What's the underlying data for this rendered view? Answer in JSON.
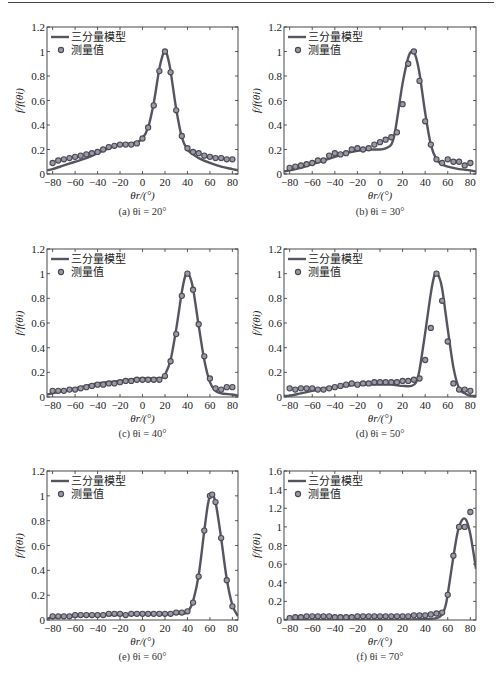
{
  "figure": {
    "legend": {
      "model_label": "三分量模型",
      "measured_label": "测量值"
    },
    "ylabel": "f/f(θi)",
    "xlabel": "θr/(°)",
    "colors": {
      "line": "#555560",
      "marker_edge": "#4a4a55",
      "marker_fill": "#9a9aa4",
      "axis": "#333333"
    }
  },
  "chart_data": [
    {
      "id": "a",
      "type": "line+scatter",
      "caption": "(a) θi = 20°",
      "incident_angle": 20,
      "xlim": [
        -85,
        85
      ],
      "ylim": [
        0,
        1.2
      ],
      "xticks": [
        -80,
        -60,
        -40,
        -20,
        0,
        20,
        40,
        60,
        80
      ],
      "yticks": [
        0,
        0.2,
        0.4,
        0.6,
        0.8,
        1,
        1.2
      ],
      "ytick_labels": [
        "0",
        "0.2",
        "0.4",
        "0.6",
        "0.8",
        "1",
        "1.2"
      ],
      "xlabel": "θr/(°)",
      "ylabel": "f/f(θi)",
      "series": [
        {
          "name": "三分量模型",
          "kind": "line",
          "x": [
            -85,
            -80,
            -70,
            -60,
            -50,
            -40,
            -30,
            -20,
            -10,
            -5,
            0,
            5,
            10,
            15,
            18,
            20,
            22,
            25,
            30,
            35,
            40,
            45,
            50,
            60,
            70,
            80,
            85
          ],
          "y": [
            0.03,
            0.04,
            0.07,
            0.1,
            0.13,
            0.17,
            0.21,
            0.24,
            0.25,
            0.26,
            0.29,
            0.38,
            0.58,
            0.86,
            0.97,
            1.0,
            0.97,
            0.84,
            0.53,
            0.3,
            0.2,
            0.16,
            0.13,
            0.09,
            0.06,
            0.04,
            0.03
          ]
        },
        {
          "name": "测量值",
          "kind": "scatter",
          "x": [
            -80,
            -75,
            -70,
            -65,
            -60,
            -55,
            -50,
            -45,
            -40,
            -35,
            -30,
            -25,
            -20,
            -15,
            -10,
            -5,
            0,
            5,
            10,
            15,
            20,
            25,
            30,
            35,
            40,
            45,
            50,
            55,
            60,
            65,
            70,
            75,
            80
          ],
          "y": [
            0.09,
            0.11,
            0.12,
            0.13,
            0.14,
            0.15,
            0.16,
            0.17,
            0.18,
            0.2,
            0.22,
            0.23,
            0.24,
            0.24,
            0.24,
            0.25,
            0.29,
            0.38,
            0.56,
            0.84,
            1.0,
            0.83,
            0.52,
            0.31,
            0.21,
            0.18,
            0.17,
            0.15,
            0.14,
            0.13,
            0.13,
            0.12,
            0.12
          ]
        }
      ]
    },
    {
      "id": "b",
      "type": "line+scatter",
      "caption": "(b) θi = 30°",
      "incident_angle": 30,
      "xlim": [
        -85,
        85
      ],
      "ylim": [
        0,
        1.2
      ],
      "xticks": [
        -80,
        -60,
        -40,
        -20,
        0,
        20,
        40,
        60,
        80
      ],
      "yticks": [
        0,
        0.2,
        0.4,
        0.6,
        0.8,
        1,
        1.2
      ],
      "ytick_labels": [
        "0",
        "0.2",
        "0.4",
        "0.6",
        "0.8",
        "1",
        "1.2"
      ],
      "xlabel": "θr/(°)",
      "ylabel": "f/f(θi)",
      "series": [
        {
          "name": "三分量模型",
          "kind": "line",
          "x": [
            -85,
            -80,
            -70,
            -60,
            -50,
            -40,
            -30,
            -20,
            -10,
            0,
            5,
            10,
            13,
            16,
            20,
            25,
            28,
            30,
            32,
            35,
            40,
            45,
            50,
            55,
            60,
            70,
            80,
            85
          ],
          "y": [
            0.02,
            0.03,
            0.05,
            0.08,
            0.11,
            0.14,
            0.17,
            0.19,
            0.2,
            0.2,
            0.21,
            0.24,
            0.33,
            0.5,
            0.74,
            0.95,
            1.0,
            0.99,
            0.95,
            0.82,
            0.5,
            0.24,
            0.12,
            0.08,
            0.06,
            0.04,
            0.03,
            0.02
          ]
        },
        {
          "name": "测量值",
          "kind": "scatter",
          "x": [
            -80,
            -75,
            -70,
            -65,
            -60,
            -55,
            -50,
            -45,
            -40,
            -35,
            -30,
            -25,
            -20,
            -15,
            -10,
            -5,
            0,
            5,
            10,
            15,
            20,
            25,
            30,
            35,
            40,
            45,
            50,
            55,
            60,
            65,
            70,
            75,
            80
          ],
          "y": [
            0.05,
            0.06,
            0.07,
            0.08,
            0.09,
            0.11,
            0.11,
            0.15,
            0.17,
            0.16,
            0.17,
            0.2,
            0.21,
            0.2,
            0.21,
            0.24,
            0.26,
            0.28,
            0.3,
            0.34,
            0.57,
            0.9,
            1.0,
            0.76,
            0.43,
            0.24,
            0.12,
            0.09,
            0.12,
            0.1,
            0.1,
            0.07,
            0.09
          ]
        }
      ]
    },
    {
      "id": "c",
      "type": "line+scatter",
      "caption": "(c) θi = 40°",
      "incident_angle": 40,
      "xlim": [
        -85,
        85
      ],
      "ylim": [
        0,
        1.2
      ],
      "xticks": [
        -80,
        -60,
        -40,
        -20,
        0,
        20,
        40,
        60,
        80
      ],
      "yticks": [
        0,
        0.2,
        0.4,
        0.6,
        0.8,
        1,
        1.2
      ],
      "ytick_labels": [
        "0",
        "0.2",
        "0.4",
        "0.6",
        "0.8",
        "1",
        "1.2"
      ],
      "xlabel": "θr/(°)",
      "ylabel": "f/f(θi)",
      "series": [
        {
          "name": "三分量模型",
          "kind": "line",
          "x": [
            -85,
            -80,
            -70,
            -60,
            -50,
            -40,
            -30,
            -20,
            -10,
            0,
            10,
            15,
            18,
            20,
            25,
            30,
            35,
            38,
            40,
            42,
            45,
            50,
            55,
            60,
            65,
            70,
            80,
            85
          ],
          "y": [
            0.02,
            0.03,
            0.05,
            0.07,
            0.09,
            0.11,
            0.12,
            0.13,
            0.14,
            0.15,
            0.15,
            0.15,
            0.16,
            0.18,
            0.3,
            0.55,
            0.85,
            0.98,
            1.0,
            0.98,
            0.88,
            0.58,
            0.3,
            0.12,
            0.05,
            0.03,
            0.02,
            0.01
          ]
        },
        {
          "name": "测量值",
          "kind": "scatter",
          "x": [
            -80,
            -75,
            -70,
            -65,
            -60,
            -55,
            -50,
            -45,
            -40,
            -35,
            -30,
            -25,
            -20,
            -15,
            -10,
            -5,
            0,
            5,
            10,
            15,
            20,
            25,
            30,
            35,
            40,
            45,
            50,
            55,
            60,
            65,
            70,
            75,
            80
          ],
          "y": [
            0.05,
            0.05,
            0.05,
            0.06,
            0.06,
            0.07,
            0.08,
            0.09,
            0.1,
            0.1,
            0.11,
            0.11,
            0.12,
            0.13,
            0.13,
            0.14,
            0.14,
            0.14,
            0.14,
            0.14,
            0.17,
            0.29,
            0.51,
            0.82,
            1.0,
            0.87,
            0.59,
            0.33,
            0.15,
            0.07,
            0.06,
            0.08,
            0.08
          ]
        }
      ]
    },
    {
      "id": "d",
      "type": "line+scatter",
      "caption": "(d) θi = 50°",
      "incident_angle": 50,
      "xlim": [
        -85,
        85
      ],
      "ylim": [
        0,
        1.2
      ],
      "xticks": [
        -80,
        -60,
        -40,
        -20,
        0,
        20,
        40,
        60,
        80
      ],
      "yticks": [
        0,
        0.2,
        0.4,
        0.6,
        0.8,
        1,
        1.2
      ],
      "ytick_labels": [
        "0",
        "0.2",
        "0.4",
        "0.6",
        "0.8",
        "1",
        "1.2"
      ],
      "xlabel": "θr/(°)",
      "ylabel": "f/f(θi)",
      "series": [
        {
          "name": "三分量模型",
          "kind": "line",
          "x": [
            -85,
            -80,
            -70,
            -60,
            -50,
            -40,
            -30,
            -20,
            -10,
            0,
            10,
            20,
            28,
            32,
            35,
            40,
            45,
            48,
            50,
            52,
            55,
            60,
            65,
            70,
            75,
            80,
            85
          ],
          "y": [
            0.01,
            0.01,
            0.03,
            0.05,
            0.07,
            0.08,
            0.09,
            0.1,
            0.1,
            0.1,
            0.1,
            0.09,
            0.09,
            0.12,
            0.22,
            0.52,
            0.84,
            0.98,
            1.0,
            0.98,
            0.88,
            0.55,
            0.24,
            0.07,
            0.03,
            0.01,
            0.01
          ]
        },
        {
          "name": "测量值",
          "kind": "scatter",
          "x": [
            -80,
            -75,
            -70,
            -65,
            -60,
            -55,
            -50,
            -45,
            -40,
            -35,
            -30,
            -25,
            -20,
            -15,
            -10,
            -5,
            0,
            5,
            10,
            15,
            20,
            25,
            30,
            35,
            40,
            45,
            50,
            55,
            60,
            65,
            70,
            75,
            80
          ],
          "y": [
            0.07,
            0.06,
            0.07,
            0.07,
            0.07,
            0.06,
            0.06,
            0.07,
            0.08,
            0.09,
            0.1,
            0.11,
            0.1,
            0.11,
            0.11,
            0.12,
            0.12,
            0.12,
            0.12,
            0.12,
            0.13,
            0.13,
            0.14,
            0.15,
            0.3,
            0.56,
            1.0,
            0.78,
            0.45,
            0.11,
            0.06,
            0.06,
            0.05
          ]
        }
      ]
    },
    {
      "id": "e",
      "type": "line+scatter",
      "caption": "(e) θi = 60°",
      "incident_angle": 60,
      "xlim": [
        -85,
        85
      ],
      "ylim": [
        0,
        1.2
      ],
      "xticks": [
        -80,
        -60,
        -40,
        -20,
        0,
        20,
        40,
        60,
        80
      ],
      "yticks": [
        0,
        0.2,
        0.4,
        0.6,
        0.8,
        1,
        1.2
      ],
      "ytick_labels": [
        "0",
        "0.2",
        "0.4",
        "0.6",
        "0.8",
        "1",
        "1.2"
      ],
      "xlabel": "θr/(°)",
      "ylabel": "f/f(θi)",
      "series": [
        {
          "name": "三分量模型",
          "kind": "line",
          "x": [
            -85,
            -80,
            -60,
            -40,
            -20,
            0,
            20,
            35,
            40,
            42,
            45,
            50,
            55,
            58,
            60,
            62,
            64,
            66,
            70,
            75,
            80,
            85
          ],
          "y": [
            0.01,
            0.02,
            0.03,
            0.04,
            0.04,
            0.05,
            0.05,
            0.05,
            0.06,
            0.09,
            0.15,
            0.36,
            0.72,
            0.92,
            1.0,
            1.02,
            0.98,
            0.9,
            0.66,
            0.33,
            0.12,
            0.03
          ]
        },
        {
          "name": "测量值",
          "kind": "scatter",
          "x": [
            -80,
            -75,
            -70,
            -65,
            -60,
            -55,
            -50,
            -45,
            -40,
            -35,
            -30,
            -25,
            -20,
            -15,
            -10,
            -5,
            0,
            5,
            10,
            15,
            20,
            25,
            30,
            35,
            40,
            45,
            50,
            55,
            60,
            62,
            65,
            70,
            75,
            80
          ],
          "y": [
            0.03,
            0.03,
            0.03,
            0.03,
            0.04,
            0.04,
            0.04,
            0.04,
            0.04,
            0.04,
            0.05,
            0.05,
            0.05,
            0.04,
            0.05,
            0.05,
            0.05,
            0.05,
            0.05,
            0.05,
            0.05,
            0.05,
            0.06,
            0.06,
            0.07,
            0.14,
            0.35,
            0.72,
            1.0,
            1.01,
            0.95,
            0.66,
            0.32,
            0.11
          ]
        }
      ]
    },
    {
      "id": "f",
      "type": "line+scatter",
      "caption": "(f) θi = 70°",
      "incident_angle": 70,
      "xlim": [
        -85,
        85
      ],
      "ylim": [
        0,
        1.6
      ],
      "xticks": [
        -80,
        -60,
        -40,
        -20,
        0,
        20,
        40,
        60,
        80
      ],
      "yticks": [
        0,
        0.2,
        0.4,
        0.6,
        0.8,
        1,
        1.2,
        1.4,
        1.6
      ],
      "ytick_labels": [
        "0",
        "0.2",
        "0.4",
        "0.6",
        "0.8",
        "1",
        "1.2",
        "1.4",
        "1.6"
      ],
      "xlabel": "θr/(°)",
      "ylabel": "f/f(θi)",
      "series": [
        {
          "name": "三分量模型",
          "kind": "line",
          "x": [
            -85,
            -80,
            -60,
            -40,
            -20,
            0,
            20,
            40,
            50,
            55,
            58,
            60,
            63,
            65,
            68,
            70,
            72,
            74,
            76,
            78,
            80,
            82,
            85
          ],
          "y": [
            0.0,
            0.0,
            0.0,
            0.0,
            0.0,
            0.0,
            0.0,
            0.01,
            0.02,
            0.06,
            0.15,
            0.28,
            0.52,
            0.68,
            0.9,
            1.0,
            1.06,
            1.09,
            1.08,
            1.02,
            0.92,
            0.78,
            0.55
          ]
        },
        {
          "name": "测量值",
          "kind": "scatter",
          "x": [
            -80,
            -75,
            -70,
            -65,
            -60,
            -55,
            -50,
            -45,
            -40,
            -35,
            -30,
            -25,
            -20,
            -15,
            -10,
            -5,
            0,
            5,
            10,
            15,
            20,
            25,
            30,
            35,
            40,
            45,
            50,
            55,
            60,
            65,
            70,
            75,
            80
          ],
          "y": [
            0.02,
            0.03,
            0.03,
            0.04,
            0.04,
            0.04,
            0.04,
            0.04,
            0.03,
            0.03,
            0.03,
            0.03,
            0.04,
            0.04,
            0.04,
            0.04,
            0.04,
            0.04,
            0.04,
            0.04,
            0.04,
            0.04,
            0.05,
            0.05,
            0.05,
            0.06,
            0.07,
            0.08,
            0.27,
            0.69,
            1.0,
            1.0,
            1.16
          ]
        }
      ]
    }
  ]
}
